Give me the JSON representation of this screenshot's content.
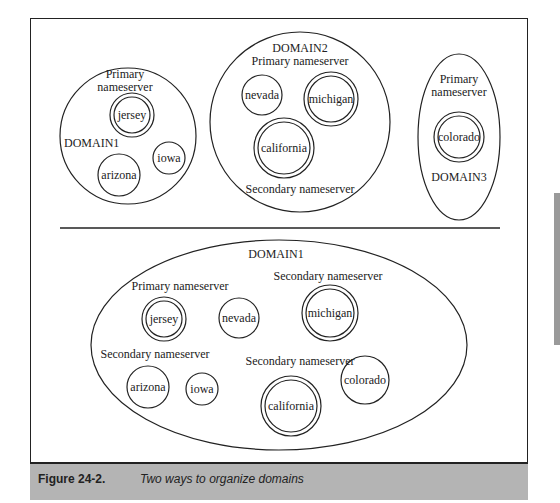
{
  "figure": {
    "number": "Figure 24-2.",
    "caption": "Two ways to organize domains"
  },
  "top_diagram": {
    "domains": [
      {
        "name": "DOMAIN1",
        "labels": [
          "Primary",
          "nameserver"
        ],
        "hosts": [
          {
            "name": "jersey",
            "role": "primary"
          },
          {
            "name": "arizona",
            "role": "host"
          },
          {
            "name": "iowa",
            "role": "host"
          }
        ]
      },
      {
        "name": "DOMAIN2",
        "primary_label": "Primary nameserver",
        "secondary_label": "Secondary nameserver",
        "hosts": [
          {
            "name": "nevada",
            "role": "host"
          },
          {
            "name": "michigan",
            "role": "primary"
          },
          {
            "name": "california",
            "role": "secondary"
          }
        ]
      },
      {
        "name": "DOMAIN3",
        "labels": [
          "Primary",
          "nameserver"
        ],
        "hosts": [
          {
            "name": "colorado",
            "role": "primary"
          }
        ]
      }
    ]
  },
  "bottom_diagram": {
    "domain": "DOMAIN1",
    "labels": {
      "primary": "Primary nameserver",
      "secondary_michigan": "Secondary nameserver",
      "secondary_arizona": "Secondary nameserver",
      "secondary_california": "Secondary nameserver"
    },
    "hosts": [
      {
        "name": "jersey",
        "role": "primary"
      },
      {
        "name": "nevada",
        "role": "host"
      },
      {
        "name": "michigan",
        "role": "secondary"
      },
      {
        "name": "arizona",
        "role": "host"
      },
      {
        "name": "iowa",
        "role": "host"
      },
      {
        "name": "california",
        "role": "secondary"
      },
      {
        "name": "colorado",
        "role": "host"
      }
    ]
  }
}
